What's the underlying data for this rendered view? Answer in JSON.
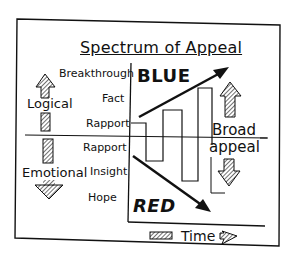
{
  "diagram": {
    "title": "Spectrum of Appeal",
    "y_axis_labels": {
      "upper": [
        "Breakthrough",
        "Fact",
        "Rapport"
      ],
      "lower": [
        "Rapport",
        "Insight",
        "Hope"
      ]
    },
    "left_labels": {
      "up": "Logical",
      "down": "Emotional"
    },
    "quadrant_labels": {
      "top": "BLUE",
      "bottom": "RED"
    },
    "right_label": {
      "line1": "Broad",
      "line2": "appeal"
    },
    "x_axis_label": "Time",
    "icons": [
      "hatched-up-arrow",
      "hatched-down-arrow",
      "hatched-right-arrow",
      "solid-diagonal-arrow"
    ],
    "colors": {
      "ink": "#111111",
      "paper": "#ffffff"
    }
  }
}
